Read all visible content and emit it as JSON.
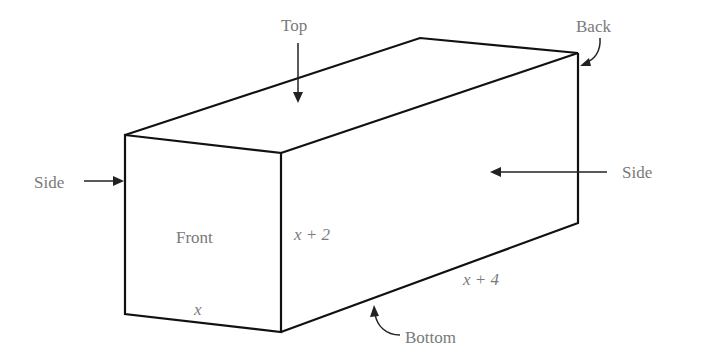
{
  "diagram": {
    "faces": {
      "top": "Top",
      "back": "Back",
      "side_left": "Side",
      "side_right": "Side",
      "front": "Front",
      "bottom": "Bottom"
    },
    "dimensions": {
      "width": "x",
      "height": "x + 2",
      "length": "x + 4"
    },
    "colors": {
      "edges": "#111111",
      "labels": "#7a7a7a",
      "background": "#ffffff"
    }
  }
}
